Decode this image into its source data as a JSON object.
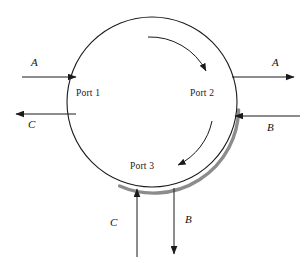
{
  "figure": {
    "type": "process-flow-schematic",
    "background_color": "#ffffff",
    "line_color": "#1a1a1a",
    "shadow_color": "#8c8c8c"
  },
  "vessel": {
    "name": "rotary-vessel",
    "shape": "circle",
    "center_x": 152,
    "center_y": 102,
    "radius": 85,
    "rotation_direction": "clockwise"
  },
  "ports": [
    {
      "id": "port-1",
      "label": "Port 1",
      "position": "left"
    },
    {
      "id": "port-2",
      "label": "Port 2",
      "position": "right"
    },
    {
      "id": "port-3",
      "label": "Port 3",
      "position": "bottom"
    }
  ],
  "streams": [
    {
      "id": "stream-a-in",
      "label": "A",
      "port": "Port 1",
      "direction": "inlet",
      "side": "left"
    },
    {
      "id": "stream-c-out",
      "label": "C",
      "port": "Port 1",
      "direction": "outlet",
      "side": "left"
    },
    {
      "id": "stream-a-out",
      "label": "A",
      "port": "Port 2",
      "direction": "outlet",
      "side": "right"
    },
    {
      "id": "stream-b-in",
      "label": "B",
      "port": "Port 2",
      "direction": "inlet",
      "side": "right"
    },
    {
      "id": "stream-c-in",
      "label": "C",
      "port": "Port 3",
      "direction": "inlet",
      "side": "bottom"
    },
    {
      "id": "stream-b-out",
      "label": "B",
      "port": "Port 3",
      "direction": "outlet",
      "side": "bottom"
    }
  ],
  "rotation_arrows": [
    {
      "id": "rotation-arrow-top",
      "position": "upper-right-interior",
      "direction": "clockwise"
    },
    {
      "id": "rotation-arrow-bottom",
      "position": "lower-right-interior",
      "direction": "clockwise"
    }
  ]
}
